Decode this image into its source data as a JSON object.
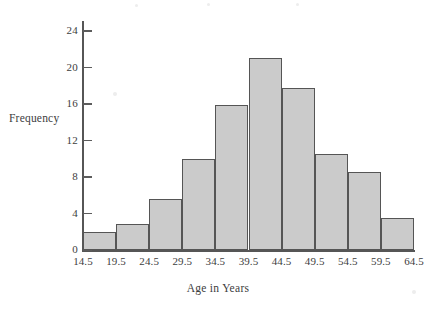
{
  "chart_data": {
    "type": "bar",
    "title": "",
    "subtitle": "",
    "xlabel": "Age in Years",
    "ylabel": "Frequency",
    "grid": false,
    "legend": false,
    "bin_width": 5,
    "bin_edges": [
      14.5,
      19.5,
      24.5,
      29.5,
      34.5,
      39.5,
      44.5,
      49.5,
      54.5,
      59.5,
      64.5
    ],
    "categories": [
      "14.5-19.5",
      "19.5-24.5",
      "24.5-29.5",
      "29.5-34.5",
      "34.5-39.5",
      "39.5-44.5",
      "44.5-49.5",
      "49.5-54.5",
      "54.5-59.5",
      "59.5-64.5"
    ],
    "values": [
      2.0,
      2.9,
      5.6,
      10.0,
      15.9,
      21.0,
      17.8,
      10.5,
      8.6,
      3.5
    ],
    "xlim": [
      14.5,
      64.5
    ],
    "ylim": [
      0,
      25
    ],
    "xticks": [
      14.5,
      19.5,
      24.5,
      29.5,
      34.5,
      39.5,
      44.5,
      49.5,
      54.5,
      59.5,
      64.5
    ],
    "xtick_labels": [
      "14.5",
      "19.5",
      "24.5",
      "29.5",
      "34.5",
      "39.5",
      "44.5",
      "49.5",
      "54.5",
      "59.5",
      "64.5"
    ],
    "yticks": [
      0,
      4,
      8,
      12,
      16,
      20,
      24
    ],
    "ytick_labels": [
      "0",
      "4",
      "8",
      "12",
      "16",
      "20",
      "24"
    ],
    "bar_fill_color": "#cbcbcb",
    "bar_edge_color": "#555555",
    "axis_color": "#565656",
    "background_color": "#ffffff"
  }
}
